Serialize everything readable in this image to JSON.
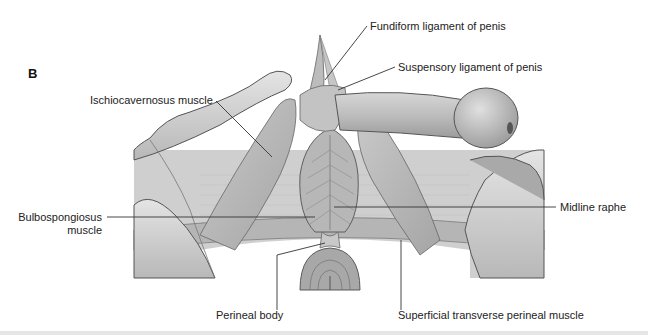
{
  "figure": {
    "panel_letter": "B",
    "colors": {
      "background": "#ffffff",
      "tissue_light": "#d9d9d9",
      "tissue_mid": "#bdbdbd",
      "tissue_dark": "#8f8f8f",
      "outline": "#555555",
      "leader_line": "#333333",
      "label_text": "#222222"
    }
  },
  "labels": {
    "fundiform": "Fundiform ligament of penis",
    "suspensory": "Suspensory ligament of penis",
    "ischiocavernosus": "Ischiocavernosus muscle",
    "bulbospongiosus_line1": "Bulbospongiosus",
    "bulbospongiosus_line2": "muscle",
    "midline_raphe": "Midline raphe",
    "perineal_body": "Perineal body",
    "superficial_transverse": "Superficial transverse perineal muscle"
  }
}
